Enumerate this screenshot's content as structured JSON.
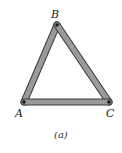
{
  "figure": {
    "caption": "(a)",
    "nodes": [
      {
        "id": "A",
        "label": "A",
        "x": 24,
        "y": 102
      },
      {
        "id": "B",
        "label": "B",
        "x": 57,
        "y": 25
      },
      {
        "id": "C",
        "label": "C",
        "x": 109,
        "y": 102
      }
    ],
    "members": [
      {
        "from": "A",
        "to": "B"
      },
      {
        "from": "B",
        "to": "C"
      },
      {
        "from": "A",
        "to": "C"
      }
    ],
    "colors": {
      "member_fill": "#9a9a9a",
      "member_edge": "#3a3a3a",
      "pin": "#1a1a1a"
    }
  }
}
